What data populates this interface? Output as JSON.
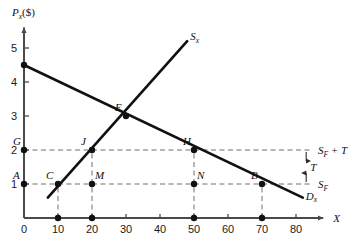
{
  "chart_data": {
    "type": "line",
    "title": "",
    "xlabel": "X",
    "ylabel_main": "P",
    "ylabel_sub": "x",
    "ylabel_unit": "($)",
    "xlim": [
      0,
      88
    ],
    "ylim": [
      0,
      5.6
    ],
    "grid": false,
    "legend": "inline-curve-labels",
    "x_ticks": [
      0,
      10,
      20,
      30,
      40,
      50,
      60,
      70,
      80
    ],
    "x_tick_labels": [
      "0",
      "10",
      "20",
      "30",
      "40",
      "50",
      "60",
      "70",
      "80"
    ],
    "y_ticks": [
      1,
      2,
      3,
      4,
      5
    ],
    "y_tick_labels": [
      "1",
      "2",
      "3",
      "4",
      "5"
    ],
    "series": [
      {
        "name": "Dx",
        "label_main": "D",
        "label_sub": "x",
        "type": "demand",
        "points": [
          [
            0,
            4.5
          ],
          [
            82,
            0.6
          ]
        ],
        "equation_note": "downward sloping"
      },
      {
        "name": "Sx",
        "label_main": "S",
        "label_sub": "x",
        "type": "supply",
        "points": [
          [
            7,
            0.6
          ],
          [
            48,
            5.2
          ]
        ],
        "equation_note": "upward sloping"
      }
    ],
    "equilibrium": {
      "label": "E",
      "x": 30,
      "y": 3
    },
    "labeled_points": [
      {
        "label": "G",
        "x": 0,
        "y": 2,
        "on": "y-axis",
        "dot": true,
        "lbl_dx": -11,
        "lbl_dy": -5
      },
      {
        "label": "A",
        "x": 0,
        "y": 1,
        "on": "y-axis",
        "dot": true,
        "lbl_dx": -11,
        "lbl_dy": -5
      },
      {
        "label": "C",
        "x": 10,
        "y": 1,
        "on": "supply",
        "dot": true,
        "lbl_dx": -12,
        "lbl_dy": -5
      },
      {
        "label": "J",
        "x": 20,
        "y": 2,
        "on": "supply",
        "dot": true,
        "lbl_dx": -11,
        "lbl_dy": -5
      },
      {
        "label": "M",
        "x": 20,
        "y": 1,
        "on": "none",
        "dot": true,
        "lbl_dx": 3,
        "lbl_dy": -5
      },
      {
        "label": "E",
        "x": 30,
        "y": 3,
        "on": "both",
        "dot": true,
        "lbl_dx": -11,
        "lbl_dy": -5
      },
      {
        "label": "H",
        "x": 50,
        "y": 2,
        "on": "demand",
        "dot": true,
        "lbl_dx": -11,
        "lbl_dy": -5
      },
      {
        "label": "N",
        "x": 50,
        "y": 1,
        "on": "none",
        "dot": true,
        "lbl_dx": 3,
        "lbl_dy": -5
      },
      {
        "label": "B",
        "x": 70,
        "y": 1,
        "on": "demand",
        "dot": true,
        "lbl_dx": -11,
        "lbl_dy": -5
      }
    ],
    "axis_dots": [
      {
        "x": 10,
        "y": 0
      },
      {
        "x": 20,
        "y": 0
      },
      {
        "x": 50,
        "y": 0
      },
      {
        "x": 70,
        "y": 0
      }
    ],
    "horizontal_dashed_lines": [
      {
        "y": 2,
        "x_from": 0,
        "x_to": 85,
        "label_main": "S",
        "label_sub": "F",
        "label_tail": " + T"
      },
      {
        "y": 1,
        "x_from": 0,
        "x_to": 85,
        "label_main": "S",
        "label_sub": "F",
        "label_tail": ""
      }
    ],
    "vertical_dashed_lines": [
      {
        "x": 10,
        "y_from": 0,
        "y_to": 1
      },
      {
        "x": 20,
        "y_from": 0,
        "y_to": 2
      },
      {
        "x": 50,
        "y_from": 0,
        "y_to": 2
      },
      {
        "x": 70,
        "y_from": 0,
        "y_to": 1
      }
    ],
    "tax_annotation": {
      "label": "T",
      "from_y": 2,
      "to_y": 1,
      "at_x": 83,
      "description": "double-headed arrow between SF and SF+T"
    },
    "colors": {
      "curve": "#111111",
      "axis": "#4a4a4a",
      "dashed": "#6e6e6e",
      "text": "#111111",
      "background": "#ffffff"
    }
  }
}
